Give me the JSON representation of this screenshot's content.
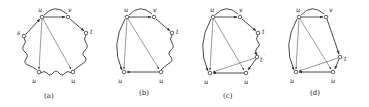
{
  "figure": {
    "panels": [
      {
        "id": "a",
        "caption": "(a)",
        "nodes": {
          "u": "u",
          "v": "v",
          "t": "t",
          "s": "s",
          "u2": "u",
          "u1": "u"
        },
        "primes": {
          "u2": "′′",
          "u1": "′"
        }
      },
      {
        "id": "b",
        "caption": "(b)",
        "nodes": {
          "u": "u",
          "v": "v",
          "t": "t",
          "u2": "u",
          "u1": "u"
        },
        "primes": {
          "u2": "′′",
          "u1": "′"
        }
      },
      {
        "id": "c",
        "caption": "(c)",
        "nodes": {
          "u": "u",
          "v": "v",
          "t": "t",
          "t1": "t",
          "u2": "u",
          "u1": "u"
        },
        "primes": {
          "t1": "′",
          "u2": "′′",
          "u1": "′"
        }
      },
      {
        "id": "d",
        "caption": "(d)",
        "nodes": {
          "u": "u",
          "v": "v",
          "t1": "t",
          "u2": "u",
          "u1": "u"
        },
        "primes": {
          "t1": "′",
          "u2": "′′",
          "u1": "′"
        }
      }
    ]
  }
}
